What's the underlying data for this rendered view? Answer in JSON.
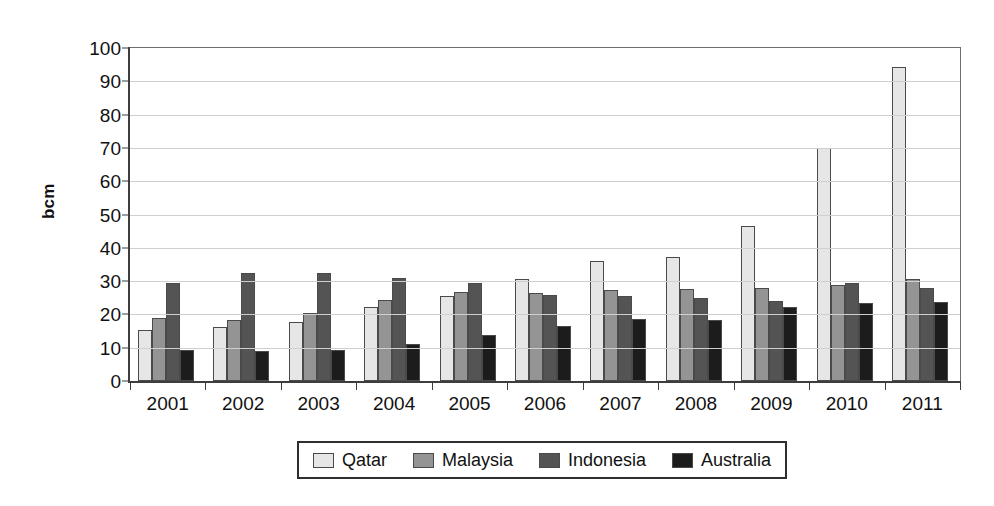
{
  "chart_data": {
    "type": "bar",
    "title": "",
    "subtitle": "",
    "xlabel": "",
    "ylabel": "bcm",
    "ylim": [
      0,
      100
    ],
    "ytick_step": 10,
    "yticks": [
      0,
      10,
      20,
      30,
      40,
      50,
      60,
      70,
      80,
      90,
      100
    ],
    "grid": true,
    "legend_position": "bottom",
    "categories": [
      "2001",
      "2002",
      "2003",
      "2004",
      "2005",
      "2006",
      "2007",
      "2008",
      "2009",
      "2010",
      "2011"
    ],
    "series": [
      {
        "name": "Qatar",
        "color": "#e6e6e6",
        "values": [
          15.3,
          16.2,
          17.6,
          22.1,
          25.4,
          30.7,
          36.0,
          37.2,
          46.5,
          70.0,
          94.3
        ]
      },
      {
        "name": "Malaysia",
        "color": "#949494",
        "values": [
          18.8,
          18.2,
          20.5,
          24.3,
          26.8,
          26.4,
          27.4,
          27.5,
          27.8,
          28.7,
          30.5
        ]
      },
      {
        "name": "Indonesia",
        "color": "#545454",
        "values": [
          29.3,
          32.5,
          32.3,
          31.0,
          29.3,
          25.9,
          25.4,
          25.0,
          23.9,
          29.3,
          27.8
        ]
      },
      {
        "name": "Australia",
        "color": "#1c1c1c",
        "values": [
          9.3,
          9.1,
          9.2,
          11.0,
          13.7,
          16.6,
          18.6,
          18.3,
          22.3,
          23.3,
          23.7
        ]
      }
    ]
  },
  "legend": {
    "entries": [
      {
        "label": "Qatar"
      },
      {
        "label": "Malaysia"
      },
      {
        "label": "Indonesia"
      },
      {
        "label": "Australia"
      }
    ]
  },
  "axes": {
    "y_title": "bcm"
  }
}
